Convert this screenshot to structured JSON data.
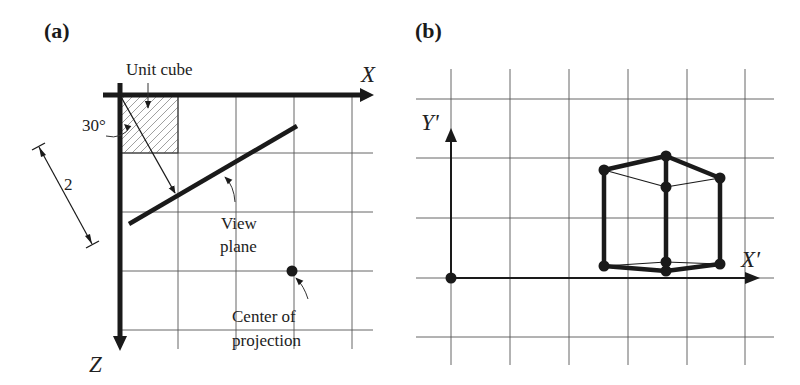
{
  "figure": {
    "panel_a": {
      "label": "(a)",
      "axis_x_label": "X",
      "axis_z_label": "Z",
      "unit_cube_label": "Unit cube",
      "angle_label": "30°",
      "distance_label": "2",
      "view_plane_label": {
        "line1": "View",
        "line2": "plane"
      },
      "center_of_projection_label": {
        "line1": "Center of",
        "line2": "projection"
      }
    },
    "panel_b": {
      "label": "(b)",
      "axis_x_label": "X′",
      "axis_y_label": "Y'"
    }
  },
  "colors": {
    "ink": "#1a1a1a",
    "grid": "#555555",
    "hatch": "#777777",
    "background": "#ffffff"
  }
}
